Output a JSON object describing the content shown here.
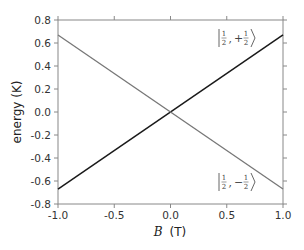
{
  "chart_data": {
    "type": "line",
    "title": "",
    "xlabel": "B (T)",
    "xlabel_italic_part": "B",
    "xlabel_unit": "(T)",
    "ylabel": "energy (K)",
    "xlim": [
      -1.0,
      1.0
    ],
    "ylim": [
      -0.8,
      0.8
    ],
    "xticks": [
      -1.0,
      -0.5,
      0.0,
      0.5,
      1.0
    ],
    "xtick_labels": [
      "-1.0",
      "-0.5",
      "0.0",
      "0.5",
      "1.0"
    ],
    "yticks": [
      0.8,
      0.6,
      0.4,
      0.2,
      0.0,
      -0.2,
      -0.4,
      -0.6,
      -0.8
    ],
    "ytick_labels": [
      "0.8",
      "0.6",
      "0.4",
      "0.2",
      "0.0",
      "-0.2",
      "-0.4",
      "-0.6",
      "-0.8"
    ],
    "grid": false,
    "legend": "inline annotations",
    "series": [
      {
        "name": "|1/2, +1/2⟩",
        "color": "#1a1a1a",
        "x": [
          -1.0,
          1.0
        ],
        "y": [
          -0.67,
          0.67
        ]
      },
      {
        "name": "|1/2, -1/2⟩",
        "color": "#777777",
        "x": [
          -1.0,
          1.0
        ],
        "y": [
          0.67,
          -0.67
        ]
      }
    ],
    "annotations": [
      {
        "text": "|1/2, +1/2⟩",
        "sign": "+",
        "x": 0.62,
        "y": 0.57
      },
      {
        "text": "|1/2, -1/2⟩",
        "sign": "−",
        "x": 0.62,
        "y": -0.67
      }
    ]
  }
}
